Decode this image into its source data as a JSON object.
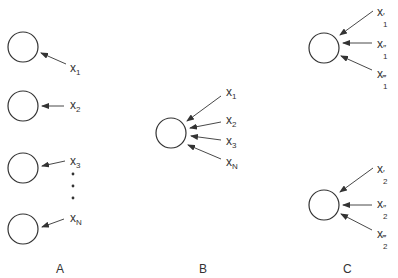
{
  "colors": {
    "stroke": "#333333",
    "text": "#333333",
    "background": "#ffffff"
  },
  "groups": [
    {
      "id": "A",
      "label": "A",
      "label_pos": [
        56,
        262
      ],
      "nodes": [
        {
          "cx": 23,
          "cy": 47,
          "r": 15,
          "inputs": [
            {
              "base": "x",
              "sub": "1",
              "sup": "",
              "pos": [
                70,
                62
              ],
              "from": [
                66,
                64
              ],
              "to": [
                41,
                53
              ]
            }
          ]
        },
        {
          "cx": 23,
          "cy": 106,
          "r": 15,
          "inputs": [
            {
              "base": "x",
              "sub": "2",
              "sup": "",
              "pos": [
                70,
                99
              ],
              "from": [
                64,
                106
              ],
              "to": [
                42,
                106
              ]
            }
          ]
        },
        {
          "cx": 23,
          "cy": 168,
          "r": 15,
          "inputs": [
            {
              "base": "x",
              "sub": "3",
              "sup": "",
              "pos": [
                70,
                155
              ],
              "from": [
                65,
                161
              ],
              "to": [
                42,
                166
              ]
            }
          ]
        },
        {
          "cx": 23,
          "cy": 229,
          "r": 15,
          "inputs": [
            {
              "base": "x",
              "sub": "N",
              "sup": "",
              "pos": [
                70,
                212
              ],
              "from": [
                64,
                219
              ],
              "to": [
                42,
                227
              ]
            }
          ]
        }
      ],
      "ellipsis_dots": [
        [
          73,
          174
        ],
        [
          73,
          186
        ],
        [
          73,
          198
        ]
      ]
    },
    {
      "id": "B",
      "label": "B",
      "label_pos": [
        199,
        262
      ],
      "nodes": [
        {
          "cx": 171,
          "cy": 133,
          "r": 15,
          "inputs": [
            {
              "base": "x",
              "sub": "1",
              "sup": "",
              "pos": [
                226,
                86
              ],
              "from": [
                221,
                96
              ],
              "to": [
                187,
                121
              ]
            },
            {
              "base": "x",
              "sub": "2",
              "sup": "",
              "pos": [
                226,
                114
              ],
              "from": [
                221,
                122
              ],
              "to": [
                190,
                128
              ]
            },
            {
              "base": "x",
              "sub": "3",
              "sup": "",
              "pos": [
                226,
                135
              ],
              "from": [
                221,
                140
              ],
              "to": [
                191,
                136
              ]
            },
            {
              "base": "x",
              "sub": "N",
              "sup": "",
              "pos": [
                226,
                156
              ],
              "from": [
                221,
                159
              ],
              "to": [
                188,
                145
              ]
            }
          ]
        }
      ]
    },
    {
      "id": "C",
      "label": "C",
      "label_pos": [
        343,
        262
      ],
      "nodes": [
        {
          "cx": 324,
          "cy": 48,
          "r": 15,
          "inputs": [
            {
              "base": "x",
              "sub": "1",
              "sup": "′",
              "pos": [
                377,
                6
              ],
              "from": [
                373,
                11
              ],
              "to": [
                340,
                35
              ]
            },
            {
              "base": "x",
              "sub": "1",
              "sup": "″",
              "pos": [
                377,
                38
              ],
              "from": [
                372,
                43
              ],
              "to": [
                343,
                43
              ]
            },
            {
              "base": "x",
              "sub": "1",
              "sup": "‴",
              "pos": [
                377,
                68
              ],
              "from": [
                372,
                70
              ],
              "to": [
                341,
                56
              ]
            }
          ]
        },
        {
          "cx": 324,
          "cy": 205,
          "r": 15,
          "inputs": [
            {
              "base": "x",
              "sub": "2",
              "sup": "′",
              "pos": [
                377,
                163
              ],
              "from": [
                373,
                168
              ],
              "to": [
                340,
                192
              ]
            },
            {
              "base": "x",
              "sub": "2",
              "sup": "″",
              "pos": [
                377,
                198
              ],
              "from": [
                372,
                205
              ],
              "to": [
                343,
                205
              ]
            },
            {
              "base": "x",
              "sub": "2",
              "sup": "‴",
              "pos": [
                377,
                228
              ],
              "from": [
                372,
                230
              ],
              "to": [
                341,
                214
              ]
            }
          ]
        }
      ]
    }
  ]
}
